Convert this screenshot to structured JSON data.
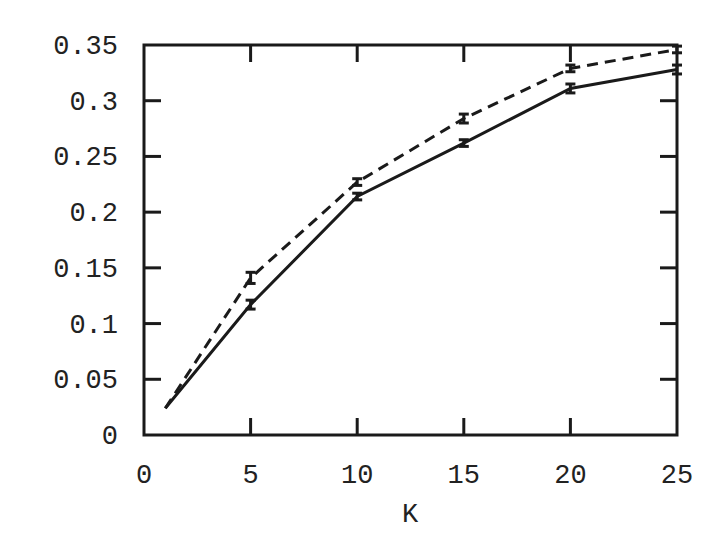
{
  "chart_data": {
    "type": "line",
    "title": "",
    "xlabel": "K",
    "ylabel": "",
    "xlim": [
      0,
      25
    ],
    "ylim": [
      0,
      0.35
    ],
    "xticks": [
      0,
      5,
      10,
      15,
      20,
      25
    ],
    "xtick_labels": [
      "0",
      "5",
      "10",
      "15",
      "20",
      "25"
    ],
    "yticks": [
      0,
      0.05,
      0.1,
      0.15,
      0.2,
      0.25,
      0.3,
      0.35
    ],
    "ytick_labels": [
      "0",
      "0.05",
      "0.1",
      "0.15",
      "0.2",
      "0.25",
      "0.3",
      "0.35"
    ],
    "grid": false,
    "legend": null,
    "x": [
      1,
      5,
      10,
      15,
      20,
      25
    ],
    "series": [
      {
        "name": "solid",
        "style": "solid",
        "values": [
          0.024,
          0.117,
          0.214,
          0.262,
          0.311,
          0.328
        ],
        "errors": [
          0,
          0.004,
          0.003,
          0.003,
          0.004,
          0.004
        ]
      },
      {
        "name": "dashed",
        "style": "dashed",
        "values": [
          0.024,
          0.141,
          0.227,
          0.284,
          0.329,
          0.346
        ],
        "errors": [
          0,
          0.005,
          0.003,
          0.004,
          0.003,
          0.003
        ]
      }
    ]
  }
}
